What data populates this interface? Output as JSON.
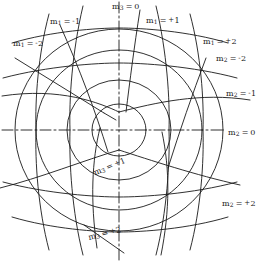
{
  "figure": {
    "type": "coordinate-net-diagram",
    "background_color": "#ffffff",
    "line_color": "#1a1a1a",
    "width": 270,
    "height": 263
  },
  "labels": [
    {
      "id": "m3-0",
      "family": "m",
      "index": "3",
      "sign": "",
      "value": "0",
      "text": "m3 = 0",
      "x": 112,
      "y": 3
    },
    {
      "id": "m1-minus1",
      "family": "m",
      "index": "1",
      "sign": "-",
      "value": "1",
      "text": "m1 = -1",
      "x": 50,
      "y": 18
    },
    {
      "id": "m1-plus1",
      "family": "m",
      "index": "1",
      "sign": "+",
      "value": "1",
      "text": "m1 = +1",
      "x": 146,
      "y": 17
    },
    {
      "id": "m1-minus2",
      "family": "m",
      "index": "1",
      "sign": "-",
      "value": "2",
      "text": "m1 = -2",
      "x": 13,
      "y": 40
    },
    {
      "id": "m1-plus2",
      "family": "m",
      "index": "1",
      "sign": "+",
      "value": "2",
      "text": "m1 = +2",
      "x": 203,
      "y": 38
    },
    {
      "id": "m2-minus2",
      "family": "m",
      "index": "2",
      "sign": "-",
      "value": "2",
      "text": "m2 = -2",
      "x": 216,
      "y": 55
    },
    {
      "id": "m2-minus1",
      "family": "m",
      "index": "2",
      "sign": "-",
      "value": "1",
      "text": "m2 = -1",
      "x": 226,
      "y": 90
    },
    {
      "id": "m2-0",
      "family": "m",
      "index": "2",
      "sign": "",
      "value": "0",
      "text": "m2 = 0",
      "x": 228,
      "y": 129
    },
    {
      "id": "m3-plus1",
      "family": "m",
      "index": "3",
      "sign": "+",
      "value": "1",
      "text": "m3 = +1",
      "x": 93,
      "y": 163,
      "rotate": -22
    },
    {
      "id": "m2-plus2",
      "family": "m",
      "index": "2",
      "sign": "+",
      "value": "2",
      "text": "m2 = +2",
      "x": 222,
      "y": 200
    },
    {
      "id": "m3-plus2",
      "family": "m",
      "index": "3",
      "sign": "+",
      "value": "2",
      "text": "m3 = +2",
      "x": 88,
      "y": 230,
      "rotate": -14
    }
  ],
  "geometry": {
    "center": {
      "x": 119,
      "y": 130
    },
    "circles_rx": [
      26,
      52,
      83,
      104
    ],
    "circles_ry": [
      25,
      50,
      80,
      100
    ],
    "axes": {
      "style": "dash-dot"
    }
  }
}
